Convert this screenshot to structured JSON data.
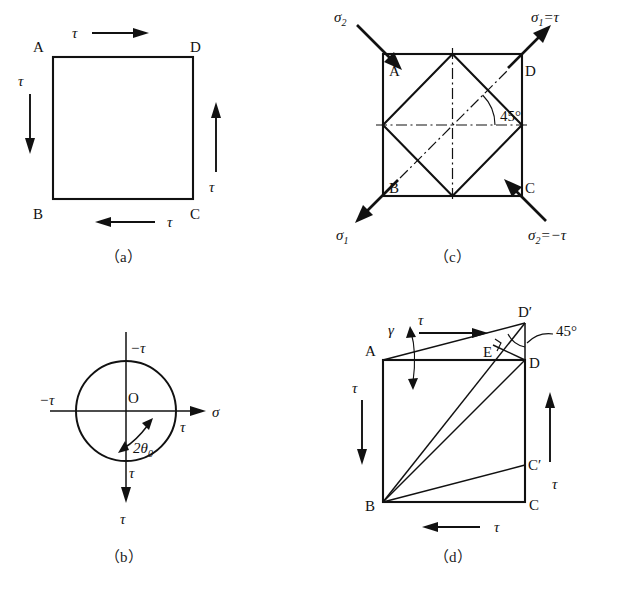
{
  "figure": {
    "background_color": "#ffffff",
    "line_color": "#111111"
  },
  "symbols": {
    "tau": "τ",
    "sigma": "σ",
    "gamma": "γ",
    "theta": "θ",
    "minus_tau": "−τ",
    "degree": "°",
    "prime": "′"
  },
  "panels": {
    "a": {
      "caption": "（a）",
      "corner_labels": {
        "top_left": "A",
        "top_right": "D",
        "bottom_left": "B",
        "bottom_right": "C"
      },
      "stress_labels": {
        "top": "τ",
        "left": "τ",
        "right": "τ",
        "bottom": "τ"
      },
      "arrow_directions": {
        "top": "right",
        "left": "down",
        "right": "up",
        "bottom": "left"
      }
    },
    "b": {
      "caption": "（b）",
      "origin_label": "O",
      "axis_labels": {
        "horizontal": "σ",
        "vertical": "τ"
      },
      "point_labels": {
        "top": "−τ",
        "left": "−τ",
        "right": "τ",
        "bottom": "τ"
      },
      "angle_label": "2θ",
      "angle_subscript": "0",
      "circle": {
        "center_x": 126,
        "center_y": 411,
        "radius": 50
      }
    },
    "c": {
      "caption": "（c）",
      "corner_labels": {
        "top_left": "A",
        "top_right": "D",
        "bottom_left": "B",
        "bottom_right": "C"
      },
      "principal_labels": {
        "top_left": "σ",
        "top_left_sub": "2",
        "top_right": "σ",
        "top_right_sub": "1",
        "top_right_rest": "=τ",
        "bottom_left": "σ",
        "bottom_left_sub": "1",
        "bottom_right": "σ",
        "bottom_right_sub": "2",
        "bottom_right_rest": "=−τ"
      },
      "angle_label": "45°"
    },
    "d": {
      "caption": "（d）",
      "corner_labels": {
        "top_left": "A",
        "top_right": "D",
        "bottom_left": "B",
        "bottom_right": "C",
        "deformed_top_right": "D′",
        "deformed_bottom_right": "C′",
        "foot_point": "E"
      },
      "stress_labels": {
        "top": "τ",
        "left": "τ",
        "right": "τ",
        "bottom": "τ"
      },
      "shear_strain_label": "γ",
      "angle_label": "45°"
    }
  }
}
